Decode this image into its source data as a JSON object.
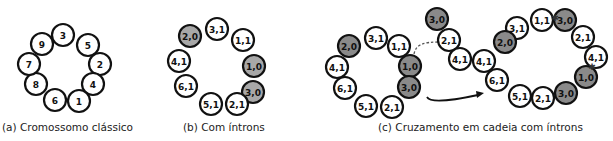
{
  "colors": {
    "white": "#ffffff",
    "gray_b": "#a8a8a8",
    "gray_c": "#8a8a8a",
    "stroke": "#111111"
  },
  "radius": 11,
  "panels": {
    "a": {
      "caption": "(a) Cromossomo clássico",
      "genes": [
        {
          "label": "3",
          "x": 63,
          "y": 35,
          "intron": false
        },
        {
          "label": "5",
          "x": 88,
          "y": 45,
          "intron": false
        },
        {
          "label": "2",
          "x": 100,
          "y": 64,
          "intron": false
        },
        {
          "label": "4",
          "x": 93,
          "y": 84,
          "intron": false
        },
        {
          "label": "1",
          "x": 79,
          "y": 101,
          "intron": false
        },
        {
          "label": "6",
          "x": 55,
          "y": 100,
          "intron": false
        },
        {
          "label": "8",
          "x": 36,
          "y": 84,
          "intron": false
        },
        {
          "label": "7",
          "x": 29,
          "y": 64,
          "intron": false
        },
        {
          "label": "9",
          "x": 42,
          "y": 44,
          "intron": false
        }
      ]
    },
    "b": {
      "caption": "(b) Com íntrons",
      "genes": [
        {
          "label": "3,1",
          "x": 217,
          "y": 29,
          "intron": false
        },
        {
          "label": "1,1",
          "x": 243,
          "y": 40,
          "intron": false
        },
        {
          "label": "1,0",
          "x": 254,
          "y": 66,
          "intron": true
        },
        {
          "label": "3,0",
          "x": 253,
          "y": 92,
          "intron": true
        },
        {
          "label": "2,1",
          "x": 237,
          "y": 104,
          "intron": false
        },
        {
          "label": "5,1",
          "x": 211,
          "y": 104,
          "intron": false
        },
        {
          "label": "6,1",
          "x": 186,
          "y": 86,
          "intron": false
        },
        {
          "label": "4,1",
          "x": 179,
          "y": 61,
          "intron": false
        },
        {
          "label": "2,0",
          "x": 190,
          "y": 36,
          "intron": true
        }
      ]
    },
    "c": {
      "caption": "(c) Cruzamento em cadeia com íntrons",
      "ring_before": [
        {
          "label": "3,1",
          "x": 376,
          "y": 38,
          "intron": false
        },
        {
          "label": "1,1",
          "x": 399,
          "y": 46,
          "intron": false
        },
        {
          "label": "1,0",
          "x": 410,
          "y": 66,
          "intron": true
        },
        {
          "label": "3,0",
          "x": 409,
          "y": 87,
          "intron": true
        },
        {
          "label": "2,1",
          "x": 392,
          "y": 107,
          "intron": false
        },
        {
          "label": "5,1",
          "x": 366,
          "y": 106,
          "intron": false
        },
        {
          "label": "6,1",
          "x": 345,
          "y": 88,
          "intron": false
        },
        {
          "label": "4,1",
          "x": 337,
          "y": 67,
          "intron": false
        },
        {
          "label": "2,0",
          "x": 349,
          "y": 46,
          "intron": true
        }
      ],
      "fragment": [
        {
          "label": "3,0",
          "x": 437,
          "y": 19,
          "intron": true
        },
        {
          "label": "2,1",
          "x": 449,
          "y": 40,
          "intron": false
        },
        {
          "label": "4,1",
          "x": 460,
          "y": 59,
          "intron": false
        }
      ],
      "ring_after": [
        {
          "label": "3,1",
          "x": 517,
          "y": 28,
          "intron": false
        },
        {
          "label": "1,1",
          "x": 542,
          "y": 20,
          "intron": false
        },
        {
          "label": "3,0",
          "x": 565,
          "y": 20,
          "intron": true
        },
        {
          "label": "2,1",
          "x": 583,
          "y": 37,
          "intron": false
        },
        {
          "label": "4,1",
          "x": 596,
          "y": 57,
          "intron": false
        },
        {
          "label": "1,0",
          "x": 586,
          "y": 77,
          "intron": true
        },
        {
          "label": "3,0",
          "x": 566,
          "y": 93,
          "intron": true
        },
        {
          "label": "2,1",
          "x": 543,
          "y": 98,
          "intron": false
        },
        {
          "label": "5,1",
          "x": 520,
          "y": 96,
          "intron": false
        },
        {
          "label": "6,1",
          "x": 497,
          "y": 80,
          "intron": false
        },
        {
          "label": "4,1",
          "x": 484,
          "y": 61,
          "intron": false
        },
        {
          "label": "2,0",
          "x": 505,
          "y": 42,
          "intron": true
        }
      ],
      "crossover_marks": [
        {
          "x": 555,
          "y": 18
        },
        {
          "x": 592,
          "y": 67
        }
      ]
    }
  }
}
